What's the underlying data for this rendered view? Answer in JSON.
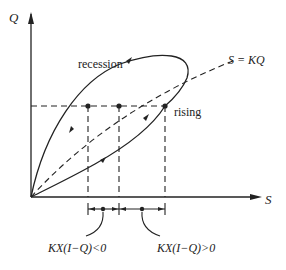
{
  "diagram": {
    "axes": {
      "y_label": "Q",
      "x_label": "S"
    },
    "labels": {
      "recession": "recession",
      "rising": "rising",
      "storage_line": "S = KQ",
      "negative_region": "KX(I−Q)<0",
      "positive_region": "KX(I−Q)>0"
    },
    "colors": {
      "stroke": "#222222",
      "background": "#ffffff"
    }
  }
}
